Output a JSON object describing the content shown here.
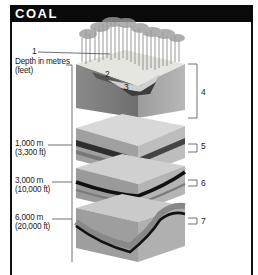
{
  "header": {
    "title": "COAL"
  },
  "axis_label": {
    "line1": "Depth in metres",
    "line2": "(feet)"
  },
  "depths": [
    {
      "line1": "1,000 m",
      "line2": "(3,300 ft)"
    },
    {
      "line1": "3,000 m",
      "line2": "(10,000 ft)"
    },
    {
      "line1": "6,000 m",
      "line2": "(20,000 ft)"
    }
  ],
  "callouts": [
    "1",
    "2",
    "3",
    "4",
    "5",
    "6",
    "7"
  ],
  "colors": {
    "header_bg": "#0a0a0a",
    "header_text": "#ffffff",
    "frame": "#111111"
  }
}
